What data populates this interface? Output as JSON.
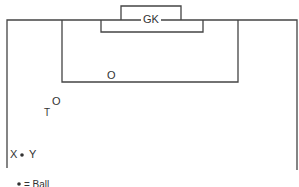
{
  "diagram": {
    "labels": {
      "goalkeeper": "GK",
      "opponent_1": "O",
      "opponent_2": "O",
      "teammate": "T",
      "player_x": "X",
      "player_y": "Y",
      "legend": "= Ball"
    },
    "colors": {
      "line": "#444444",
      "text": "#333333",
      "background": "#ffffff"
    }
  }
}
